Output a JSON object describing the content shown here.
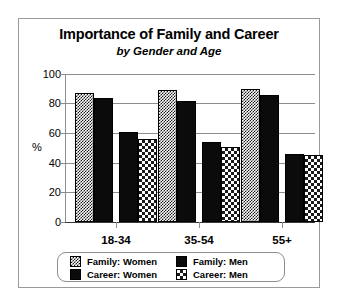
{
  "chart_data": {
    "type": "bar",
    "title": "Importance of Family and Career",
    "subtitle": "by Gender and Age",
    "xlabel": "",
    "ylabel": "%",
    "ylim": [
      0,
      100
    ],
    "yticks": [
      0,
      20,
      40,
      60,
      80,
      100
    ],
    "grid": true,
    "legend_position": "bottom",
    "categories": [
      "18-34",
      "35-54",
      "55+"
    ],
    "series": [
      {
        "name": "Family: Women",
        "pattern": "fine-checker",
        "values": [
          87,
          89,
          90
        ]
      },
      {
        "name": "Family: Men",
        "pattern": "solid-black",
        "values": [
          84,
          82,
          86
        ]
      },
      {
        "name": "Career: Women",
        "pattern": "solid-black",
        "values": [
          61,
          54,
          46
        ]
      },
      {
        "name": "Career: Men",
        "pattern": "coarse-checker",
        "values": [
          56,
          51,
          45
        ]
      }
    ]
  },
  "axis": {
    "y_tick_labels": [
      "100",
      "80",
      "60",
      "40",
      "20",
      "0"
    ],
    "y_axis_title": "%",
    "x_tick_labels": [
      "18-34",
      "35-54",
      "55+"
    ]
  },
  "legend": {
    "entries": [
      {
        "label": "Family: Women"
      },
      {
        "label": "Family: Men"
      },
      {
        "label": "Career: Women"
      },
      {
        "label": "Career: Men"
      }
    ]
  },
  "colors": {
    "ink": "#000000",
    "grid": "#8d8d8d",
    "frame": "#9a9a9a",
    "background": "#ffffff"
  }
}
